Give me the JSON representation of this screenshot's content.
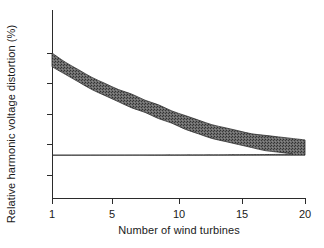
{
  "chart_data": {
    "type": "area",
    "title": "",
    "subtitle": "",
    "xlabel": "Number of wind turbines",
    "ylabel": "Relative harmonic voltage distortion (%)",
    "xlim": [
      1,
      20
    ],
    "ylim": [
      0,
      108
    ],
    "grid": false,
    "legend": "none",
    "xticks": [
      1,
      5,
      10,
      15,
      20
    ],
    "xticklabels": [
      "1",
      "5",
      "10",
      "15",
      "20"
    ],
    "yticks": [
      20,
      40,
      60,
      80,
      100
    ],
    "yticklabels": [
      "20",
      "40",
      "60",
      "80",
      "100"
    ],
    "band_color": "#5a5a5a",
    "axis_color": "#2b2b2b",
    "x": [
      1,
      2,
      3,
      4,
      5,
      6,
      7,
      8,
      9,
      10,
      11,
      12,
      13,
      14,
      15,
      16,
      17,
      18,
      19,
      20
    ],
    "series": [
      {
        "name": "upper bound",
        "values": [
          100,
          94,
          89,
          84,
          80,
          76,
          73,
          69,
          66,
          62,
          59,
          56,
          53,
          51,
          49,
          47,
          46,
          45,
          44,
          43
        ]
      },
      {
        "name": "lower bound",
        "values": [
          91,
          86,
          81,
          76,
          72,
          68,
          64,
          61,
          57,
          54,
          50,
          47,
          44,
          42,
          40,
          38,
          36,
          35,
          34,
          33
        ]
      }
    ],
    "annotations": []
  },
  "axes": {
    "ylabel": "Relative harmonic voltage distortion (%)",
    "xlabel": "Number of wind turbines"
  }
}
